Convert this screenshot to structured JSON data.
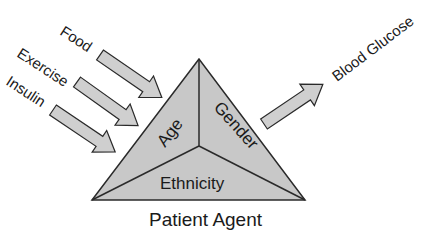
{
  "diagram": {
    "title": "Patient Agent",
    "inputs": [
      {
        "label": "Food"
      },
      {
        "label": "Exercise"
      },
      {
        "label": "Insulin"
      }
    ],
    "output": {
      "label": "Blood Glucose"
    },
    "triangle_faces": {
      "left": "Age",
      "right": "Gender",
      "bottom": "Ethnicity"
    },
    "colors": {
      "fill": "#c8c8c8",
      "stroke": "#2a2a2a",
      "arrow_fill": "#cfcfcf",
      "text": "#1a1a1a"
    }
  }
}
